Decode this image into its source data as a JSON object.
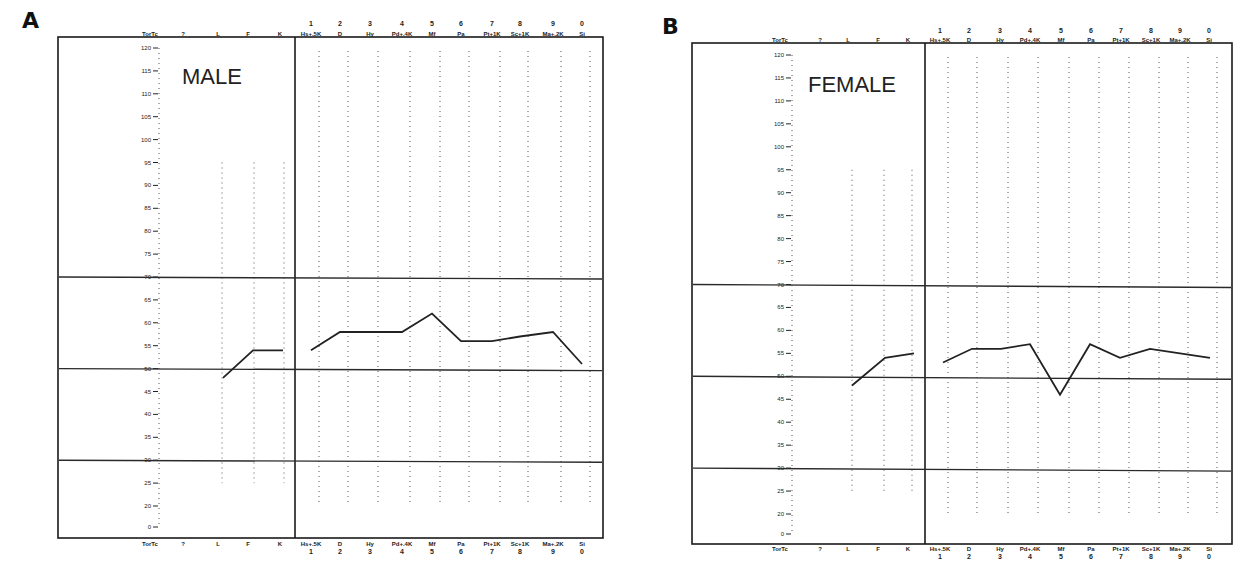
{
  "panels": [
    {
      "letter": "A",
      "label": "MALE",
      "top_headers": {
        "left": [
          "TorTc",
          "?",
          "L",
          "F",
          "K"
        ],
        "scale_numbers": [
          "1",
          "2",
          "3",
          "4",
          "5",
          "6",
          "7",
          "8",
          "9",
          "0"
        ],
        "scale_names": [
          "Hs+.5K",
          "D",
          "Hy",
          "Pd+.4K",
          "Mf",
          "Pa",
          "Pt+1K",
          "Sc+1K",
          "Ma+.2K",
          "Si"
        ]
      }
    },
    {
      "letter": "B",
      "label": "FEMALE",
      "top_headers": {
        "left": [
          "TorTc",
          "?",
          "L",
          "F",
          "K"
        ],
        "scale_numbers": [
          "1",
          "2",
          "3",
          "4",
          "5",
          "6",
          "7",
          "8",
          "9",
          "0"
        ],
        "scale_names": [
          "Hs+.5K",
          "D",
          "Hy",
          "Pd+.4K",
          "Mf",
          "Pa",
          "Pt+1K",
          "Sc+1K",
          "Ma+.2K",
          "Si"
        ]
      }
    }
  ],
  "t_axis": {
    "labels": [
      "120",
      "115",
      "110",
      "105",
      "100",
      "95",
      "90",
      "85",
      "80",
      "75",
      "70",
      "65",
      "60",
      "55",
      "50",
      "45",
      "40",
      "35",
      "30",
      "25",
      "20",
      "0"
    ]
  },
  "chart_data": [
    {
      "type": "line",
      "title": "MALE",
      "panel": "A",
      "x": [
        "L",
        "F",
        "K",
        "Hs+.5K",
        "D",
        "Hy",
        "Pd+.4K",
        "Mf",
        "Pa",
        "Pt+1K",
        "Sc+1K",
        "Ma+.2K",
        "Si"
      ],
      "series": [
        {
          "name": "Mean profile (T score)",
          "values": [
            48,
            54,
            54,
            54,
            58,
            58,
            58,
            62,
            56,
            56,
            57,
            58,
            51
          ]
        }
      ],
      "ylabel": "T or Tc",
      "ylim": [
        0,
        120
      ],
      "reference_lines": [
        30,
        50,
        70
      ],
      "grid": false
    },
    {
      "type": "line",
      "title": "FEMALE",
      "panel": "B",
      "x": [
        "L",
        "F",
        "K",
        "Hs+.5K",
        "D",
        "Hy",
        "Pd+.4K",
        "Mf",
        "Pa",
        "Pt+1K",
        "Sc+1K",
        "Ma+.2K",
        "Si"
      ],
      "series": [
        {
          "name": "Mean profile (T score)",
          "values": [
            48,
            54,
            55,
            53,
            56,
            56,
            57,
            46,
            57,
            54,
            56,
            55,
            54
          ]
        }
      ],
      "ylabel": "T or Tc",
      "ylim": [
        0,
        120
      ],
      "reference_lines": [
        30,
        50,
        70
      ],
      "grid": false
    }
  ]
}
